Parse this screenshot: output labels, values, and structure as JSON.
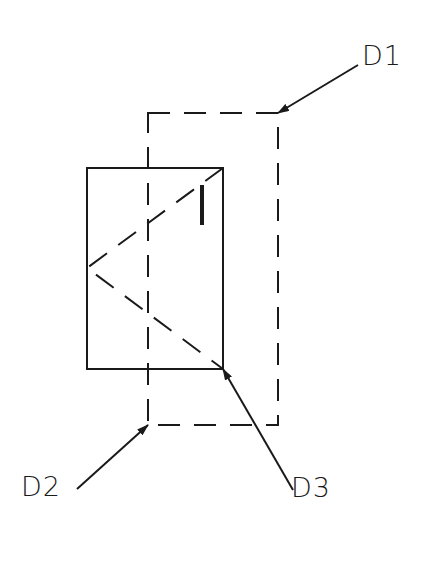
{
  "diagram": {
    "labels": {
      "d1": "D1",
      "d2": "D2",
      "d3": "D3"
    },
    "colors": {
      "stroke": "#1a1a1a",
      "background": "#ffffff"
    },
    "elements": [
      {
        "id": "dashed-rectangle",
        "style": "dashed",
        "x": 148,
        "y": 113,
        "w": 130,
        "h": 312
      },
      {
        "id": "solid-rectangle",
        "style": "solid",
        "x": 87,
        "y": 168,
        "w": 136,
        "h": 201
      },
      {
        "id": "reflection-path",
        "style": "dashed",
        "points": [
          [
            223,
            168
          ],
          [
            87,
            268
          ],
          [
            223,
            369
          ]
        ]
      },
      {
        "id": "reflector-mark",
        "style": "thick",
        "x": 202,
        "y1": 185,
        "y2": 225
      }
    ],
    "leaders": [
      {
        "label": "D1",
        "from": [
          358,
          65
        ],
        "to": [
          278,
          113
        ]
      },
      {
        "label": "D2",
        "from": [
          77,
          489
        ],
        "to": [
          148,
          425
        ]
      },
      {
        "label": "D3",
        "from": [
          293,
          490
        ],
        "to": [
          223,
          369
        ]
      }
    ]
  }
}
